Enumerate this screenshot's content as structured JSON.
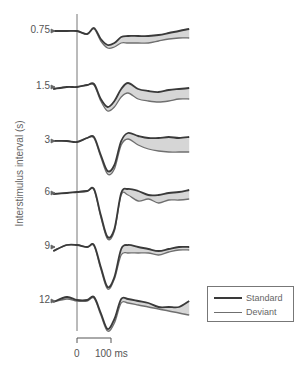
{
  "chart_data": {
    "type": "line",
    "title": "",
    "ylabel": "Interstimulus interval (s)",
    "xlabel": "",
    "scale_bar": {
      "start_label": "0",
      "end_label": "100 ms"
    },
    "legend": [
      {
        "name": "Standard",
        "color": "#3a3a3a"
      },
      {
        "name": "Deviant",
        "color": "#6f6f6f"
      }
    ],
    "fill_color": "#d6d6d6",
    "categories": [
      "0.75",
      "1.5",
      "3",
      "6",
      "9",
      "12"
    ],
    "series_note": "ERP waveforms (Standard vs Deviant) per interstimulus interval; shaded area = difference (mismatch). Values are relative pixel offsets from each trace baseline (positive = downward).",
    "time_ms": [
      -70,
      -30,
      0,
      30,
      50,
      70,
      90,
      110,
      130,
      150,
      180,
      210,
      240,
      270,
      300,
      330
    ],
    "traces": [
      {
        "isi": "0.75",
        "baseline_y": 31,
        "standard": [
          0,
          0,
          0,
          3,
          -3,
          8,
          14,
          12,
          6,
          5,
          5,
          5,
          4,
          2,
          0,
          -2
        ],
        "deviant": [
          0,
          0,
          0,
          3,
          -2,
          10,
          17,
          16,
          12,
          12,
          12,
          12,
          10,
          8,
          7,
          7
        ]
      },
      {
        "isi": "1.5",
        "baseline_y": 87,
        "standard": [
          2,
          0,
          0,
          -2,
          -3,
          12,
          20,
          14,
          2,
          -4,
          2,
          4,
          5,
          3,
          2,
          1
        ],
        "deviant": [
          2,
          0,
          0,
          -2,
          -2,
          14,
          24,
          20,
          10,
          6,
          12,
          14,
          15,
          14,
          12,
          12
        ]
      },
      {
        "isi": "3",
        "baseline_y": 141,
        "standard": [
          0,
          0,
          1,
          -3,
          -4,
          14,
          30,
          24,
          0,
          -8,
          -5,
          -3,
          -3,
          -4,
          -3,
          -4
        ],
        "deviant": [
          0,
          0,
          1,
          -3,
          -3,
          16,
          33,
          28,
          4,
          -2,
          4,
          8,
          10,
          11,
          11,
          11
        ]
      },
      {
        "isi": "6",
        "baseline_y": 193,
        "standard": [
          1,
          0,
          -1,
          -2,
          -4,
          22,
          44,
          36,
          0,
          -4,
          -2,
          2,
          2,
          0,
          -1,
          -3
        ],
        "deviant": [
          1,
          0,
          -1,
          -2,
          -3,
          24,
          46,
          38,
          2,
          2,
          8,
          6,
          10,
          7,
          7,
          6
        ]
      },
      {
        "isi": "9",
        "baseline_y": 247,
        "standard": [
          4,
          -2,
          -2,
          0,
          -2,
          20,
          40,
          30,
          2,
          -2,
          0,
          2,
          4,
          2,
          0,
          0
        ],
        "deviant": [
          4,
          -2,
          -2,
          0,
          -1,
          22,
          42,
          32,
          8,
          6,
          6,
          6,
          8,
          5,
          3,
          3
        ]
      },
      {
        "isi": "12",
        "baseline_y": 301,
        "standard": [
          1,
          -4,
          -1,
          -1,
          -4,
          12,
          28,
          18,
          -2,
          -2,
          0,
          2,
          6,
          6,
          6,
          0
        ],
        "deviant": [
          1,
          -2,
          0,
          0,
          -3,
          14,
          30,
          22,
          2,
          2,
          4,
          6,
          8,
          10,
          12,
          14
        ]
      }
    ]
  },
  "labels": {
    "ylabel": "Interstimulus interval (s)",
    "ticks": [
      "0.75",
      "1.5",
      "3",
      "6",
      "9",
      "12"
    ],
    "scale_start": "0",
    "scale_end": "100 ms",
    "legend_standard": "Standard",
    "legend_deviant": "Deviant"
  },
  "colors": {
    "standard": "#3a3a3a",
    "deviant": "#6f6f6f",
    "fill": "#d6d6d6",
    "axis": "#666666"
  }
}
